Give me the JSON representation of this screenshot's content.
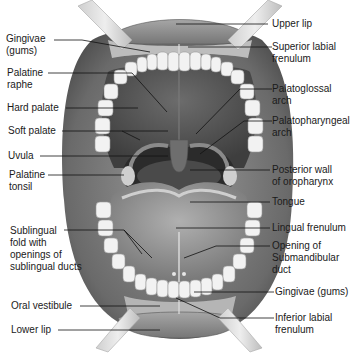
{
  "diagram": {
    "colors": {
      "background": "#ffffff",
      "lip": "#8c8c8c",
      "cheek": "#6e6e6e",
      "teeth": "#eeeeee",
      "gums": "#b9b9b9",
      "palate": "#5c5c5c",
      "tongue": "#9a9a9a",
      "pharynx": "#2e2e2e",
      "retractor": "#d8d8d8",
      "leader_line": "#111111"
    },
    "labels_left": [
      {
        "id": "gingivae-upper",
        "lines": [
          "Gingivae",
          "(gums)"
        ]
      },
      {
        "id": "palatine-raphe",
        "lines": [
          "Palatine",
          "raphe"
        ]
      },
      {
        "id": "hard-palate",
        "lines": [
          "Hard palate"
        ]
      },
      {
        "id": "soft-palate",
        "lines": [
          "Soft palate"
        ]
      },
      {
        "id": "uvula",
        "lines": [
          "Uvula"
        ]
      },
      {
        "id": "palatine-tonsil",
        "lines": [
          "Palatine",
          "tonsil"
        ]
      },
      {
        "id": "sublingual-fold",
        "lines": [
          "Sublingual",
          "fold with",
          "openings of",
          "sublingual ducts"
        ]
      },
      {
        "id": "oral-vestibule",
        "lines": [
          "Oral vestibule"
        ]
      },
      {
        "id": "lower-lip",
        "lines": [
          "Lower lip"
        ]
      }
    ],
    "labels_right": [
      {
        "id": "upper-lip",
        "lines": [
          "Upper lip"
        ]
      },
      {
        "id": "superior-labial-frenulum",
        "lines": [
          "Superior labial",
          "frenulum"
        ]
      },
      {
        "id": "palatoglossal-arch",
        "lines": [
          "Palatoglossal",
          "arch"
        ]
      },
      {
        "id": "palatopharyngeal-arch",
        "lines": [
          "Palatopharyngeal",
          "arch"
        ]
      },
      {
        "id": "posterior-wall",
        "lines": [
          "Posterior wall",
          "of oropharynx"
        ]
      },
      {
        "id": "tongue",
        "lines": [
          "Tongue"
        ]
      },
      {
        "id": "lingual-frenulum",
        "lines": [
          "Lingual frenulum"
        ]
      },
      {
        "id": "submandibular-duct",
        "lines": [
          "Opening of",
          "Submandibular",
          "duct"
        ]
      },
      {
        "id": "gingivae-lower",
        "lines": [
          "Gingivae (gums)"
        ]
      },
      {
        "id": "inferior-labial-frenulum",
        "lines": [
          "Inferior labial",
          "frenulum"
        ]
      }
    ]
  }
}
